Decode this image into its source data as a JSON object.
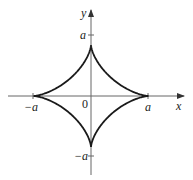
{
  "figure": {
    "type": "astroid",
    "equation": "x^(2/3) + y^(2/3) = a^(2/3)",
    "colors": {
      "axis": "#555555",
      "curve": "#1a1a1a",
      "text": "#222222",
      "background": "#ffffff"
    }
  },
  "axes": {
    "x_label": "x",
    "y_label": "y",
    "origin_label": "0",
    "x_ticks": [
      {
        "label": "−a",
        "value": -1
      },
      {
        "label": "a",
        "value": 1
      }
    ],
    "y_ticks": [
      {
        "label": "a",
        "value": 1
      },
      {
        "label": "−a",
        "value": -1
      }
    ]
  },
  "curve": {
    "cusps": [
      {
        "name": "right",
        "x": 1,
        "y": 0
      },
      {
        "name": "top",
        "x": 0,
        "y": 1
      },
      {
        "name": "left",
        "x": -1,
        "y": 0
      },
      {
        "name": "bottom",
        "x": 0,
        "y": -1
      }
    ]
  },
  "geometry": {
    "cx": 91,
    "cy": 96,
    "rx": 57.5,
    "ry": 51
  }
}
